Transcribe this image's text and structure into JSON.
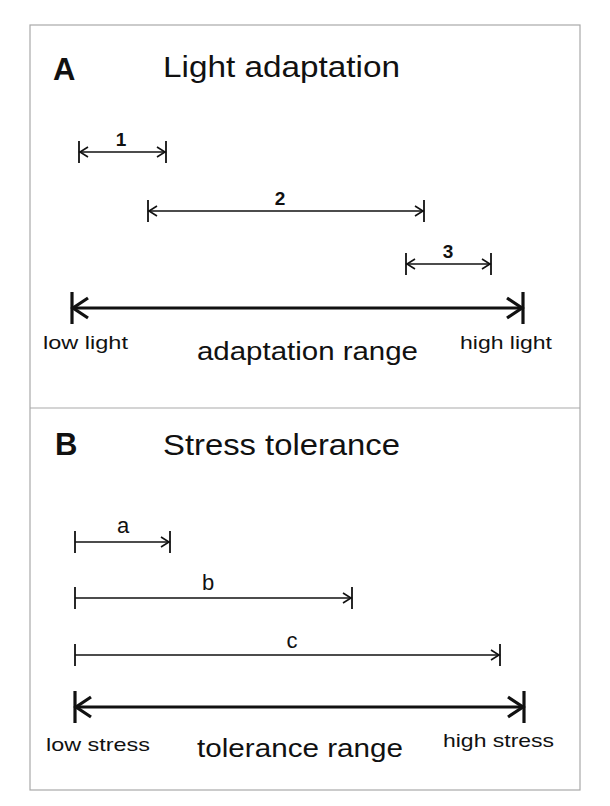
{
  "figure": {
    "frame": {
      "x": 30,
      "y": 25,
      "width": 550,
      "height": 765,
      "divider_y": 408,
      "border_color": "#a9a9a9"
    },
    "ink_color": "#111111",
    "panels": [
      {
        "id": "A",
        "letter": "A",
        "title": "Light adaptation",
        "letter_pos": [
          53,
          80
        ],
        "title_pos": [
          163,
          77
        ],
        "bars": [
          {
            "label": "1",
            "x1": 79,
            "x2": 166,
            "y": 152,
            "label_x": 121,
            "label_y": 146,
            "left_arrow": true,
            "right_arrow": true
          },
          {
            "label": "2",
            "x1": 148,
            "x2": 424,
            "y": 211,
            "label_x": 280,
            "label_y": 205,
            "left_arrow": true,
            "right_arrow": true
          },
          {
            "label": "3",
            "x1": 406,
            "x2": 491,
            "y": 264,
            "label_x": 448,
            "label_y": 258,
            "left_arrow": true,
            "right_arrow": true
          }
        ],
        "bar_label_style": "bold",
        "range": {
          "x1": 72,
          "x2": 523,
          "y": 308,
          "low_label": "low light",
          "high_label": "high light",
          "range_label": "adaptation range",
          "low_pos": [
            43,
            349
          ],
          "high_pos": [
            460,
            349
          ],
          "range_pos": [
            197,
            360
          ]
        }
      },
      {
        "id": "B",
        "letter": "B",
        "title": "Stress tolerance",
        "letter_pos": [
          55,
          455
        ],
        "title_pos": [
          163,
          455
        ],
        "bars": [
          {
            "label": "a",
            "x1": 75,
            "x2": 170,
            "y": 542,
            "label_x": 123,
            "label_y": 533,
            "left_arrow": false,
            "right_arrow": true
          },
          {
            "label": "b",
            "x1": 75,
            "x2": 352,
            "y": 598,
            "label_x": 208,
            "label_y": 590,
            "left_arrow": false,
            "right_arrow": true
          },
          {
            "label": "c",
            "x1": 75,
            "x2": 500,
            "y": 655,
            "label_x": 292,
            "label_y": 648,
            "left_arrow": false,
            "right_arrow": true
          }
        ],
        "bar_label_style": "regular",
        "range": {
          "x1": 75,
          "x2": 524,
          "y": 707,
          "low_label": "low stress",
          "high_label": "high stress",
          "range_label": "tolerance range",
          "low_pos": [
            46,
            751
          ],
          "high_pos": [
            443,
            747
          ],
          "range_pos": [
            197,
            757
          ]
        }
      }
    ]
  }
}
